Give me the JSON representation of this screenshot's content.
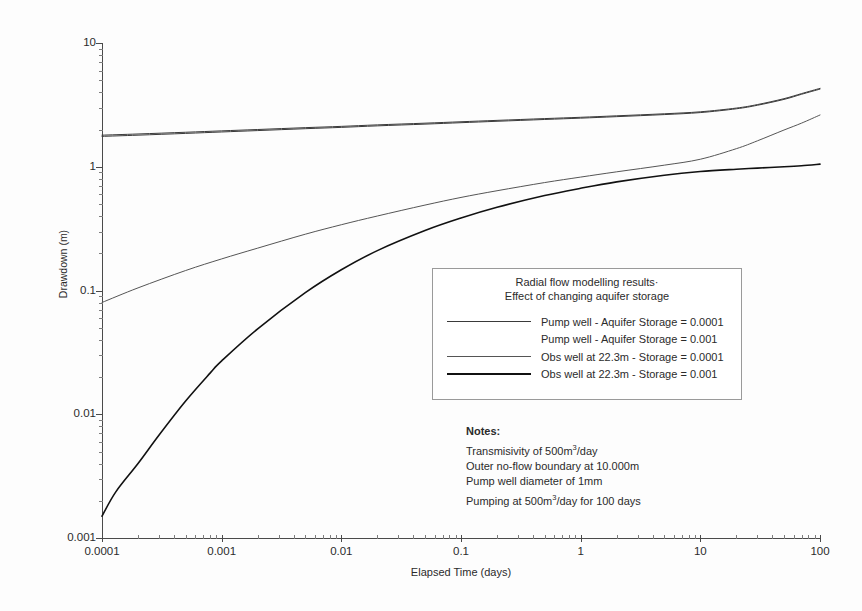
{
  "chart_data": {
    "type": "line",
    "xlabel": "Elapsed Time (days)",
    "ylabel": "Drawdown (m)",
    "xscale": "log",
    "yscale": "log",
    "xlim": [
      0.0001,
      100
    ],
    "ylim": [
      0.001,
      10
    ],
    "xticks": [
      "0.0001",
      "0.001",
      "0.01",
      "0.1",
      "1",
      "10",
      "100"
    ],
    "yticks": [
      "0.001",
      "0.01",
      "0.1",
      "1",
      "10"
    ],
    "grid": false,
    "legend_position": "center-right-inside",
    "series": [
      {
        "name": "Pump well - Aquifer Storage = 0.0001",
        "color": "#3a3a3a",
        "width": 1.0,
        "x": [
          0.0001,
          0.0002,
          0.0005,
          0.001,
          0.002,
          0.005,
          0.01,
          0.02,
          0.05,
          0.1,
          0.2,
          0.5,
          1,
          2,
          5,
          10,
          20,
          30,
          50,
          70,
          100
        ],
        "y": [
          1.8,
          1.84,
          1.9,
          1.95,
          2.0,
          2.07,
          2.12,
          2.18,
          2.25,
          2.31,
          2.37,
          2.45,
          2.51,
          2.58,
          2.68,
          2.78,
          2.98,
          3.18,
          3.55,
          3.9,
          4.3
        ]
      },
      {
        "name": "Pump well - Aquifer Storage = 0.001",
        "color": "#3a3a3a",
        "width": 1.0,
        "x": [
          0.0001,
          0.0002,
          0.0005,
          0.001,
          0.002,
          0.005,
          0.01,
          0.02,
          0.05,
          0.1,
          0.2,
          0.5,
          1,
          2,
          5,
          10,
          20,
          30,
          50,
          70,
          100
        ],
        "y": [
          1.76,
          1.8,
          1.86,
          1.91,
          1.96,
          2.03,
          2.08,
          2.14,
          2.21,
          2.27,
          2.33,
          2.41,
          2.47,
          2.54,
          2.64,
          2.74,
          2.94,
          3.14,
          3.5,
          3.85,
          4.24
        ]
      },
      {
        "name": "Obs well at 22.3m -  Storage = 0.0001",
        "color": "#555555",
        "width": 1.0,
        "x": [
          0.0001,
          0.0002,
          0.0005,
          0.001,
          0.002,
          0.005,
          0.01,
          0.02,
          0.05,
          0.1,
          0.2,
          0.5,
          1,
          2,
          5,
          10,
          20,
          30,
          50,
          70,
          100
        ],
        "y": [
          0.08,
          0.105,
          0.145,
          0.18,
          0.22,
          0.285,
          0.34,
          0.4,
          0.49,
          0.565,
          0.64,
          0.745,
          0.825,
          0.91,
          1.03,
          1.15,
          1.4,
          1.62,
          1.98,
          2.25,
          2.62
        ]
      },
      {
        "name": "Obs well at 22.3m - Storage = 0.001",
        "color": "#111111",
        "width": 1.6,
        "x": [
          0.0001,
          0.00013,
          0.0002,
          0.0003,
          0.0005,
          0.0008,
          0.001,
          0.002,
          0.005,
          0.01,
          0.02,
          0.05,
          0.1,
          0.2,
          0.5,
          1,
          2,
          5,
          10,
          20,
          30,
          50,
          70,
          100
        ],
        "y": [
          0.0015,
          0.00235,
          0.004,
          0.0068,
          0.0128,
          0.0215,
          0.027,
          0.049,
          0.096,
          0.147,
          0.21,
          0.305,
          0.385,
          0.47,
          0.585,
          0.67,
          0.755,
          0.855,
          0.915,
          0.955,
          0.975,
          1.0,
          1.02,
          1.05
        ]
      }
    ]
  },
  "axes": {
    "y_title": "Drawdown (m)",
    "x_title": "Elapsed Time (days)",
    "y_labels": [
      "10",
      "1",
      "0.1",
      "0.01",
      "0.001"
    ],
    "x_labels": [
      "0.0001",
      "0.001",
      "0.01",
      "0.1",
      "1",
      "10",
      "100"
    ]
  },
  "legend": {
    "title_line1": "Radial flow modelling results·",
    "title_line2": "Effect of changing aquifer storage",
    "entries": [
      "Pump well - Aquifer Storage = 0.0001",
      "Pump well - Aquifer Storage = 0.001",
      "Obs well at 22.3m -  Storage = 0.0001",
      "Obs well at 22.3m - Storage = 0.001"
    ]
  },
  "notes": {
    "heading": "Notes:",
    "lines": [
      "Transmisivity of 500m³/day",
      "Outer no-flow boundary at 10.000m",
      "Pump well diameter of 1mm",
      "Pumping at 500m³/day for 100 days"
    ]
  }
}
